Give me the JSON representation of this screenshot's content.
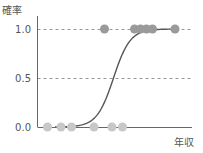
{
  "chart_data": {
    "type": "scatter",
    "title": "",
    "xlabel": "年収",
    "ylabel": "確率",
    "ylim": [
      0,
      1
    ],
    "xlim": [
      0,
      10
    ],
    "yticks": [
      {
        "value": 0.0,
        "label": "0.0"
      },
      {
        "value": 0.5,
        "label": "0.5"
      },
      {
        "value": 1.0,
        "label": "1.0"
      }
    ],
    "reference_lines": [
      0.5,
      1.0
    ],
    "grid": false,
    "legend": "none",
    "series": [
      {
        "name": "observed-0",
        "type": "scatter",
        "color": "#c8c8c8",
        "points": [
          {
            "x": 0.5,
            "y": 0
          },
          {
            "x": 1.4,
            "y": 0
          },
          {
            "x": 2.1,
            "y": 0
          },
          {
            "x": 3.6,
            "y": 0
          },
          {
            "x": 4.8,
            "y": 0
          },
          {
            "x": 5.5,
            "y": 0
          }
        ]
      },
      {
        "name": "observed-1",
        "type": "scatter",
        "color": "#9a9a9a",
        "points": [
          {
            "x": 4.3,
            "y": 1
          },
          {
            "x": 6.3,
            "y": 1
          },
          {
            "x": 6.7,
            "y": 1
          },
          {
            "x": 7.1,
            "y": 1
          },
          {
            "x": 7.5,
            "y": 1
          },
          {
            "x": 9.0,
            "y": 1
          }
        ]
      },
      {
        "name": "logistic-curve",
        "type": "line",
        "color": "#555555",
        "midpoint": 4.9,
        "steepness": 1.8,
        "x_range": [
          1.0,
          9.0
        ]
      }
    ]
  }
}
